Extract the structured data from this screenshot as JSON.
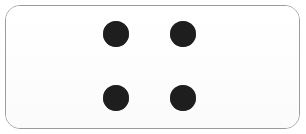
{
  "card": {
    "name": "domino-tile",
    "shape": "rounded-rectangle",
    "fill_color": "#fdfdfd",
    "border_color": "#9b9b9b",
    "border_width_px": 1,
    "corner_radius_px": 15,
    "x": 5,
    "y": 5,
    "width": 295,
    "height": 124
  },
  "background": {
    "color": "#ffffff"
  },
  "pips": {
    "count": 4,
    "color": "#1e1e1e",
    "diameter_px": 26,
    "arrangement": "2x2-grid",
    "items": [
      {
        "name": "pip-top-left",
        "cx": 116,
        "cy": 34,
        "r": 13
      },
      {
        "name": "pip-top-right",
        "cx": 183,
        "cy": 34,
        "r": 13
      },
      {
        "name": "pip-bottom-left",
        "cx": 116,
        "cy": 98,
        "r": 13
      },
      {
        "name": "pip-bottom-right",
        "cx": 183,
        "cy": 98,
        "r": 13
      }
    ]
  }
}
